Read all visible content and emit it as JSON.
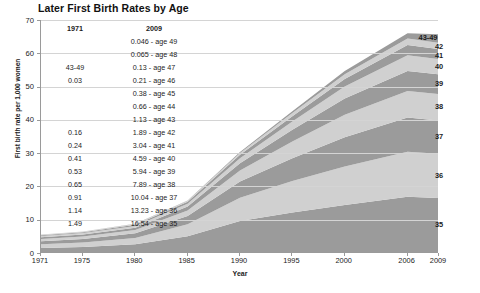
{
  "chart_data": {
    "type": "area",
    "title": "Later First Birth Rates by Age",
    "xlabel": "Year",
    "ylabel": "First birth rate per 1,000 women",
    "xlim": [
      1971,
      2009
    ],
    "ylim": [
      0,
      70
    ],
    "ygrid": true,
    "ytick_step": 10,
    "stacked": true,
    "legend_position": "right-inline",
    "y_ticks": [
      "0",
      "10",
      "20",
      "30",
      "40",
      "50",
      "60",
      "70"
    ],
    "x_ticks": [
      "1971",
      "1975",
      "1980",
      "1985",
      "1990",
      "1995",
      "2000",
      "2006",
      "2009"
    ],
    "x": [
      1971,
      1975,
      1980,
      1985,
      1990,
      1995,
      2000,
      2006,
      2009
    ],
    "series": [
      {
        "name": "35",
        "label": "35",
        "color": "#9b9b9b",
        "values": [
          1.49,
          1.8,
          2.6,
          5.0,
          9.6,
          12.2,
          14.4,
          16.9,
          16.54
        ]
      },
      {
        "name": "36",
        "label": "36",
        "color": "#d0d0d0",
        "values": [
          1.14,
          1.35,
          1.9,
          3.6,
          7.0,
          9.4,
          11.6,
          13.5,
          13.23
        ]
      },
      {
        "name": "37",
        "label": "37",
        "color": "#9b9b9b",
        "values": [
          0.91,
          1.05,
          1.4,
          2.5,
          4.9,
          6.9,
          8.8,
          10.3,
          10.04
        ]
      },
      {
        "name": "38",
        "label": "38",
        "color": "#d0d0d0",
        "values": [
          0.65,
          0.76,
          1.0,
          1.7,
          3.3,
          5.0,
          6.7,
          8.0,
          7.89
        ]
      },
      {
        "name": "39",
        "label": "39",
        "color": "#9b9b9b",
        "values": [
          0.53,
          0.58,
          0.72,
          1.2,
          2.2,
          3.5,
          4.9,
          6.0,
          5.94
        ]
      },
      {
        "name": "40",
        "label": "40",
        "color": "#d0d0d0",
        "values": [
          0.41,
          0.44,
          0.52,
          0.82,
          1.5,
          2.5,
          3.6,
          4.7,
          4.59
        ]
      },
      {
        "name": "41",
        "label": "41",
        "color": "#9b9b9b",
        "values": [
          0.24,
          0.28,
          0.35,
          0.54,
          0.98,
          1.6,
          2.3,
          3.1,
          3.04
        ]
      },
      {
        "name": "42",
        "label": "42",
        "color": "#d0d0d0",
        "values": [
          0.16,
          0.18,
          0.22,
          0.33,
          0.58,
          0.95,
          1.4,
          1.95,
          1.89
        ]
      },
      {
        "name": "43-49",
        "label": "43-49",
        "color": "#9b9b9b",
        "values": [
          0.03,
          0.04,
          0.06,
          0.12,
          0.28,
          0.55,
          1.0,
          1.6,
          2.585
        ]
      }
    ],
    "annotation_table": {
      "col1_header": "1971",
      "col2_header": "2009",
      "rows": [
        {
          "v1971": "",
          "v2009": "0.046 - age 49"
        },
        {
          "v1971": "",
          "v2009": "0.065 - age 48"
        },
        {
          "v1971": "43-49",
          "v2009": "0.13 - age 47"
        },
        {
          "v1971": "0.03",
          "v2009": "0.21 - age 46"
        },
        {
          "v1971": "",
          "v2009": "0.38 - age 45"
        },
        {
          "v1971": "",
          "v2009": "0.66 - age 44"
        },
        {
          "v1971": "",
          "v2009": "1.13 - age 43"
        },
        {
          "v1971": "0.16",
          "v2009": "1.89 - age 42"
        },
        {
          "v1971": "0.24",
          "v2009": "3.04 - age 41"
        },
        {
          "v1971": "0.41",
          "v2009": "4.59 - age 40"
        },
        {
          "v1971": "0.53",
          "v2009": "5.94 - age 39"
        },
        {
          "v1971": "0.65",
          "v2009": "7.89 - age 38"
        },
        {
          "v1971": "0.91",
          "v2009": "10.04 - age 37"
        },
        {
          "v1971": "1.14",
          "v2009": "13.23 - age 36"
        },
        {
          "v1971": "1.49",
          "v2009": "16.54 - age 35"
        }
      ]
    }
  }
}
